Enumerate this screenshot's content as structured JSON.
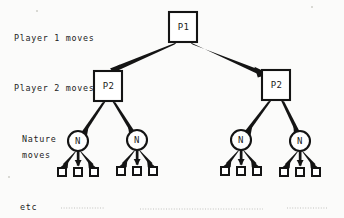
{
  "figure": {
    "background_color": "#fbfbfa",
    "ink_color": "#141414"
  },
  "row_labels": [
    {
      "id": "player-1-row",
      "text": "Player 1 moves",
      "x": 14,
      "y": 41
    },
    {
      "id": "player-2-row",
      "text": "Player 2 moves",
      "x": 14,
      "y": 91
    },
    {
      "id": "nature-row-line-1",
      "text": "Nature",
      "x": 22,
      "y": 142
    },
    {
      "id": "nature-row-line-2",
      "text": "moves",
      "x": 22,
      "y": 158
    }
  ],
  "footer": {
    "etc_label": "etc",
    "etc_x": 20,
    "etc_y": 210
  },
  "nodes": {
    "root": {
      "label": "P1",
      "x": 169,
      "y": 12,
      "w": 28,
      "h": 30,
      "shape": "square"
    },
    "players2": [
      {
        "label": "P2",
        "x": 94,
        "y": 71,
        "w": 28,
        "h": 30,
        "shape": "square"
      },
      {
        "label": "P2",
        "x": 262,
        "y": 70,
        "w": 28,
        "h": 30,
        "shape": "square"
      }
    ],
    "nature": [
      {
        "label": "N",
        "cx": 78,
        "cy": 141,
        "r": 10,
        "shape": "circle"
      },
      {
        "label": "N",
        "cx": 137,
        "cy": 140,
        "r": 10,
        "shape": "circle"
      },
      {
        "label": "N",
        "cx": 241,
        "cy": 140,
        "r": 10,
        "shape": "circle"
      },
      {
        "label": "N",
        "cx": 300,
        "cy": 141,
        "r": 10,
        "shape": "circle"
      }
    ],
    "terminals": [
      {
        "x": 58,
        "y": 168,
        "size": 8
      },
      {
        "x": 74,
        "y": 168,
        "size": 8
      },
      {
        "x": 90,
        "y": 168,
        "size": 8
      },
      {
        "x": 117,
        "y": 168,
        "size": 8
      },
      {
        "x": 133,
        "y": 168,
        "size": 8
      },
      {
        "x": 149,
        "y": 168,
        "size": 8
      },
      {
        "x": 221,
        "y": 168,
        "size": 8
      },
      {
        "x": 237,
        "y": 168,
        "size": 8
      },
      {
        "x": 253,
        "y": 168,
        "size": 8
      },
      {
        "x": 280,
        "y": 168,
        "size": 8
      },
      {
        "x": 296,
        "y": 168,
        "size": 8
      },
      {
        "x": 312,
        "y": 168,
        "size": 8
      }
    ]
  },
  "edges": {
    "from_root": [
      {
        "from": "root",
        "to": "p2-left",
        "x1": 176,
        "y1": 43,
        "x2": 113,
        "y2": 70
      },
      {
        "from": "root",
        "to": "p2-right",
        "x1": 191,
        "y1": 43,
        "x2": 262,
        "y2": 69
      }
    ],
    "from_player2": [
      {
        "from": "p2-left",
        "to": "nature-1",
        "x1": 104,
        "y1": 102,
        "x2": 81,
        "y2": 131
      },
      {
        "from": "p2-left",
        "to": "nature-2",
        "x1": 114,
        "y1": 102,
        "x2": 134,
        "y2": 131
      },
      {
        "from": "p2-right",
        "to": "nature-3",
        "x1": 270,
        "y1": 101,
        "x2": 245,
        "y2": 131
      },
      {
        "from": "p2-right",
        "to": "nature-4",
        "x1": 282,
        "y1": 101,
        "x2": 297,
        "y2": 131
      }
    ],
    "from_nature": [
      {
        "from": "nature-1",
        "to": "terminal-1",
        "x1": 76,
        "y1": 151,
        "x2": 62,
        "y2": 166
      },
      {
        "from": "nature-1",
        "to": "terminal-2",
        "x1": 78,
        "y1": 151,
        "x2": 78,
        "y2": 166
      },
      {
        "from": "nature-1",
        "to": "terminal-3",
        "x1": 80,
        "y1": 151,
        "x2": 94,
        "y2": 166
      },
      {
        "from": "nature-2",
        "to": "terminal-4",
        "x1": 135,
        "y1": 150,
        "x2": 121,
        "y2": 166
      },
      {
        "from": "nature-2",
        "to": "terminal-5",
        "x1": 137,
        "y1": 150,
        "x2": 137,
        "y2": 166
      },
      {
        "from": "nature-2",
        "to": "terminal-6",
        "x1": 139,
        "y1": 150,
        "x2": 153,
        "y2": 166
      },
      {
        "from": "nature-3",
        "to": "terminal-7",
        "x1": 239,
        "y1": 150,
        "x2": 225,
        "y2": 166
      },
      {
        "from": "nature-3",
        "to": "terminal-8",
        "x1": 241,
        "y1": 150,
        "x2": 241,
        "y2": 166
      },
      {
        "from": "nature-3",
        "to": "terminal-9",
        "x1": 243,
        "y1": 150,
        "x2": 257,
        "y2": 166
      },
      {
        "from": "nature-4",
        "to": "terminal-10",
        "x1": 298,
        "y1": 151,
        "x2": 284,
        "y2": 166
      },
      {
        "from": "nature-4",
        "to": "terminal-11",
        "x1": 300,
        "y1": 151,
        "x2": 300,
        "y2": 166
      },
      {
        "from": "nature-4",
        "to": "terminal-12",
        "x1": 302,
        "y1": 151,
        "x2": 316,
        "y2": 166
      }
    ]
  },
  "scan_artifacts": [
    {
      "x1": 61,
      "y1": 208,
      "x2": 104,
      "y2": 208
    },
    {
      "x1": 140,
      "y1": 209,
      "x2": 263,
      "y2": 209
    },
    {
      "x1": 287,
      "y1": 208,
      "x2": 327,
      "y2": 208
    }
  ]
}
